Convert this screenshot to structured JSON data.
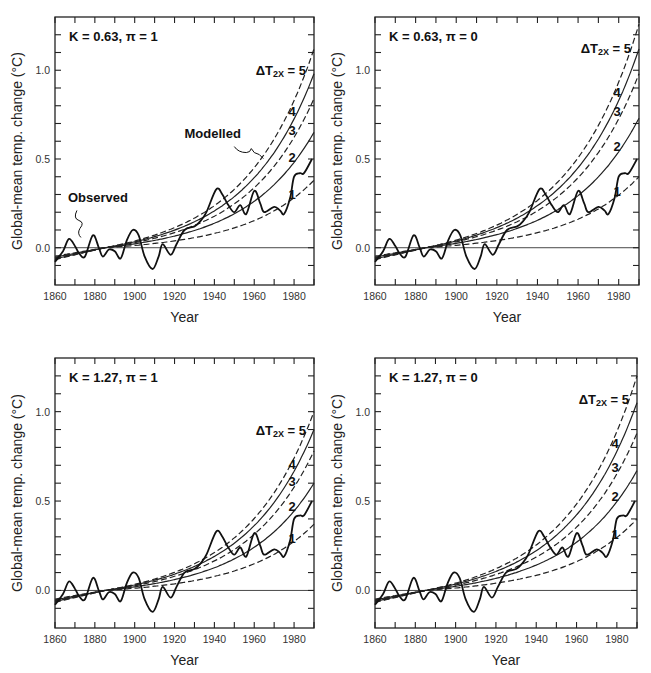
{
  "figure": {
    "x_axis_label": "Year",
    "y_axis_label": "Global-mean temp. change (°C)",
    "legend_prefix": "ΔT",
    "legend_sub": "2X",
    "legend_eq": " = ",
    "annotations": {
      "observed": "Observed",
      "modelled": "Modelled"
    }
  },
  "chart_data": [
    {
      "type": "line",
      "title": "K = 0.63, π = 1",
      "xlabel": "Year",
      "ylabel": "Global-mean temp. change (°C)",
      "xlim": [
        1860,
        1990
      ],
      "ylim": [
        -0.21,
        1.3
      ],
      "xticks": [
        1860,
        1880,
        1900,
        1920,
        1940,
        1960,
        1980
      ],
      "yticks": [
        0.0,
        0.5,
        1.0
      ],
      "annotations": [
        "Observed",
        "Modelled"
      ],
      "series": [
        {
          "name": "Observed",
          "style": "solid-wavy",
          "x": [
            1860,
            1864,
            1867,
            1870,
            1872,
            1875,
            1879,
            1882,
            1884,
            1887,
            1890,
            1893,
            1896,
            1899,
            1902,
            1905,
            1909,
            1912,
            1914,
            1918,
            1921,
            1925,
            1930,
            1933,
            1936,
            1941,
            1944,
            1947,
            1950,
            1953,
            1956,
            1960,
            1963,
            1965,
            1970,
            1973,
            1975,
            1978,
            1980,
            1983,
            1985,
            1989
          ],
          "values": [
            -0.08,
            -0.02,
            0.05,
            0.01,
            -0.03,
            -0.05,
            0.07,
            0.0,
            -0.05,
            -0.01,
            -0.02,
            -0.06,
            0.04,
            0.1,
            0.07,
            -0.05,
            -0.12,
            -0.05,
            0.02,
            -0.04,
            0.02,
            0.1,
            0.12,
            0.15,
            0.2,
            0.33,
            0.3,
            0.24,
            0.2,
            0.24,
            0.19,
            0.32,
            0.25,
            0.2,
            0.23,
            0.21,
            0.19,
            0.28,
            0.4,
            0.42,
            0.42,
            0.5
          ]
        },
        {
          "name": "ΔT2x = 5",
          "style": "dashed",
          "end_value": 1.12
        },
        {
          "name": "ΔT2x = 4",
          "style": "solid",
          "end_value": 0.98
        },
        {
          "name": "ΔT2x = 3",
          "style": "dashed",
          "end_value": 0.84
        },
        {
          "name": "ΔT2x = 2",
          "style": "solid",
          "end_value": 0.65
        },
        {
          "name": "ΔT2x = 1",
          "style": "dashed",
          "end_value": 0.38
        }
      ],
      "curve_labels": [
        "5",
        "4",
        "3",
        "2",
        "1"
      ]
    },
    {
      "type": "line",
      "title": "K = 0.63, π = 0",
      "xlabel": "Year",
      "ylabel": "Global-mean temp. change (°C)",
      "xlim": [
        1860,
        1990
      ],
      "ylim": [
        -0.21,
        1.3
      ],
      "xticks": [
        1860,
        1880,
        1900,
        1920,
        1940,
        1960,
        1980
      ],
      "yticks": [
        0.0,
        0.5,
        1.0
      ],
      "series": [
        {
          "name": "Observed",
          "style": "solid-wavy",
          "same_as_panel": 0
        },
        {
          "name": "ΔT2x = 5",
          "style": "dashed",
          "end_value": 1.26
        },
        {
          "name": "ΔT2x = 4",
          "style": "solid",
          "end_value": 1.12
        },
        {
          "name": "ΔT2x = 3",
          "style": "dashed",
          "end_value": 0.98
        },
        {
          "name": "ΔT2x = 2",
          "style": "solid",
          "end_value": 0.73
        },
        {
          "name": "ΔT2x = 1",
          "style": "dashed",
          "end_value": 0.4
        }
      ],
      "curve_labels": [
        "5",
        "4",
        "3",
        "2",
        "1"
      ]
    },
    {
      "type": "line",
      "title": "K = 1.27, π = 1",
      "xlabel": "Year",
      "ylabel": "Global-mean temp. change (°C)",
      "xlim": [
        1860,
        1990
      ],
      "ylim": [
        -0.21,
        1.3
      ],
      "xticks": [
        1860,
        1880,
        1900,
        1920,
        1940,
        1960,
        1980
      ],
      "yticks": [
        0.0,
        0.5,
        1.0
      ],
      "series": [
        {
          "name": "Observed",
          "style": "solid-wavy",
          "same_as_panel": 0
        },
        {
          "name": "ΔT2x = 5",
          "style": "dashed",
          "end_value": 1.0
        },
        {
          "name": "ΔT2x = 4",
          "style": "solid",
          "end_value": 0.9
        },
        {
          "name": "ΔT2x = 3",
          "style": "dashed",
          "end_value": 0.78
        },
        {
          "name": "ΔT2x = 2",
          "style": "solid",
          "end_value": 0.6
        },
        {
          "name": "ΔT2x = 1",
          "style": "dashed",
          "end_value": 0.37
        }
      ],
      "curve_labels": [
        "5",
        "4",
        "3",
        "2",
        "1"
      ]
    },
    {
      "type": "line",
      "title": "K = 1.27, π = 0",
      "xlabel": "Year",
      "ylabel": "Global-mean temp. change (°C)",
      "xlim": [
        1860,
        1990
      ],
      "ylim": [
        -0.21,
        1.3
      ],
      "xticks": [
        1860,
        1880,
        1900,
        1920,
        1940,
        1960,
        1980
      ],
      "yticks": [
        0.0,
        0.5,
        1.0
      ],
      "series": [
        {
          "name": "Observed",
          "style": "solid-wavy",
          "same_as_panel": 0
        },
        {
          "name": "ΔT2x = 5",
          "style": "dashed",
          "end_value": 1.2
        },
        {
          "name": "ΔT2x = 4",
          "style": "solid",
          "end_value": 1.05
        },
        {
          "name": "ΔT2x = 3",
          "style": "dashed",
          "end_value": 0.88
        },
        {
          "name": "ΔT2x = 2",
          "style": "solid",
          "end_value": 0.67
        },
        {
          "name": "ΔT2x = 1",
          "style": "dashed",
          "end_value": 0.4
        }
      ],
      "curve_labels": [
        "5",
        "4",
        "3",
        "2",
        "1"
      ]
    }
  ]
}
